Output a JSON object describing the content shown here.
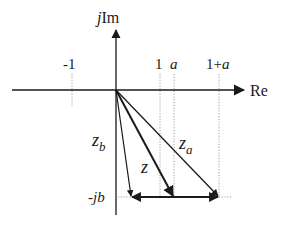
{
  "diagram": {
    "type": "complex-plane phasor diagram",
    "axes": {
      "imag_label_prefix": "j",
      "imag_label": "Im",
      "real_label": "Re"
    },
    "tick_labels": {
      "minus_one": "-1",
      "one": "1",
      "a": "a",
      "one_plus_a_prefix": "1+",
      "one_plus_a_var": "a",
      "minus_jb": "-jb"
    },
    "vectors": [
      {
        "name": "z_b",
        "symbol": "z",
        "subscript": "b",
        "tip": "-jb"
      },
      {
        "name": "z",
        "symbol": "z",
        "subscript": "",
        "tip": "a - jb"
      },
      {
        "name": "z_a",
        "symbol": "z",
        "subscript": "a",
        "tip": "1 + a - jb"
      }
    ],
    "bottom_arrows": [
      {
        "from": "a - jb",
        "to": "-jb",
        "direction": "left"
      },
      {
        "from": "a - jb",
        "to": "1 + a - jb",
        "direction": "right"
      }
    ],
    "colors": {
      "ink": "#1a1a1a",
      "guide": "#888888",
      "background": "#ffffff"
    }
  }
}
